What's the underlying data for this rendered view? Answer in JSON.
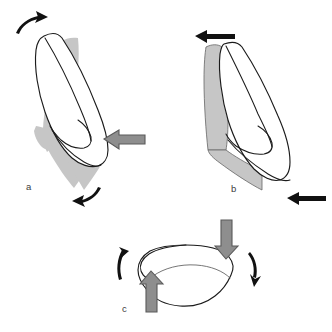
{
  "figure": {
    "background_color": "#ffffff",
    "width": 332,
    "height": 332,
    "panel_count": 3
  },
  "colors": {
    "outline_stroke": "#1b1b1b",
    "tooth_fill": "#ffffff",
    "shaded_region_fill": "#c6c6c6",
    "shaded_region_stroke": "#6d6d6d",
    "force_arrow_fill": "#8e8e8e",
    "force_arrow_stroke": "#5a5a5a",
    "motion_arrow_fill": "#111111",
    "label_color": "#3b3b3b"
  },
  "panels": [
    {
      "id": "a",
      "label": "a",
      "label_x": 26,
      "label_y": 190,
      "description": "Tipping: single horizontal force on the crown produces crown movement one way and root movement the other way",
      "force_arrows": [
        {
          "name": "force-arrow-crown-a",
          "icon": "block-arrow-left-icon",
          "direction": "left",
          "color": "#8e8e8e"
        }
      ],
      "motion_arrows": [
        {
          "name": "motion-arrow-top-a",
          "icon": "curved-arrow-icon",
          "direction": "clockwise-up-right",
          "color": "#111111"
        },
        {
          "name": "motion-arrow-bottom-a",
          "icon": "curved-arrow-icon",
          "direction": "clockwise-down-left",
          "color": "#111111"
        }
      ]
    },
    {
      "id": "b",
      "label": "b",
      "label_x": 231,
      "label_y": 192,
      "description": "Bodily translation: a force couple moves crown and root equally in the same direction",
      "force_arrows": [],
      "motion_arrows": [
        {
          "name": "motion-arrow-top-b",
          "icon": "straight-arrow-left-icon",
          "direction": "left",
          "color": "#111111"
        },
        {
          "name": "motion-arrow-bottom-b",
          "icon": "straight-arrow-left-icon",
          "direction": "left",
          "color": "#111111"
        }
      ]
    },
    {
      "id": "c",
      "label": "c",
      "label_x": 122,
      "label_y": 312,
      "description": "Occlusal view: opposing vertical forces create rotation of the tooth about its long axis",
      "force_arrows": [
        {
          "name": "force-arrow-down-c",
          "icon": "block-arrow-down-icon",
          "direction": "down",
          "color": "#8e8e8e"
        },
        {
          "name": "force-arrow-up-c",
          "icon": "block-arrow-up-icon",
          "direction": "up",
          "color": "#8e8e8e"
        }
      ],
      "motion_arrows": [
        {
          "name": "motion-arrow-left-c",
          "icon": "curved-arrow-icon",
          "direction": "up",
          "color": "#111111"
        },
        {
          "name": "motion-arrow-right-c",
          "icon": "curved-arrow-icon",
          "direction": "down",
          "color": "#111111"
        }
      ]
    }
  ]
}
